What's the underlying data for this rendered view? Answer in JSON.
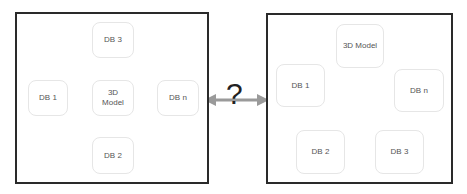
{
  "left_panel": {
    "title": "Hub architecture",
    "center": "3D\nModel",
    "nodes": {
      "top": "DB 3",
      "left": "DB 1",
      "right": "DB n",
      "bottom": "DB 2"
    }
  },
  "middle": {
    "symbol": "?"
  },
  "right_panel": {
    "title": "Ring architecture",
    "nodes": {
      "top": "3D Model",
      "left": "DB 1",
      "right": "DB n",
      "bottom_left": "DB 2",
      "bottom_right": "DB 3"
    }
  },
  "colors": {
    "arrow": "#9a9a9a",
    "border": "#2a2a2a",
    "node_border": "#e6e6e6",
    "text": "#555555"
  }
}
